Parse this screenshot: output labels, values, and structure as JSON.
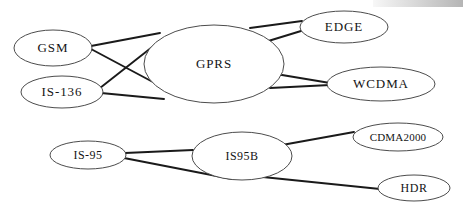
{
  "diagram": {
    "type": "node-link-graph",
    "background_color": "#ffffff",
    "node_stroke_color": "#4c4c4c",
    "edge_color": "#1a1a1a",
    "label_color": "#141414",
    "nodes": [
      {
        "id": "gsm",
        "label": "GSM",
        "cx": 53,
        "cy": 48,
        "rx": 39,
        "ry": 18,
        "font": "node-label"
      },
      {
        "id": "is136",
        "label": "IS-136",
        "cx": 62,
        "cy": 92,
        "rx": 41,
        "ry": 16,
        "font": "node-label"
      },
      {
        "id": "gprs",
        "label": "GPRS",
        "cx": 214,
        "cy": 64,
        "rx": 70,
        "ry": 39,
        "font": "node-label"
      },
      {
        "id": "edge",
        "label": "EDGE",
        "cx": 344,
        "cy": 27,
        "rx": 44,
        "ry": 16,
        "font": "node-label"
      },
      {
        "id": "wcdma",
        "label": "WCDMA",
        "cx": 381,
        "cy": 84,
        "rx": 54,
        "ry": 17,
        "font": "node-label"
      },
      {
        "id": "is95",
        "label": "IS-95",
        "cx": 88,
        "cy": 155,
        "rx": 38,
        "ry": 14,
        "font": "node-label small"
      },
      {
        "id": "is95b",
        "label": "IS95B",
        "cx": 242,
        "cy": 156,
        "rx": 50,
        "ry": 24,
        "font": "node-label small"
      },
      {
        "id": "cdma2000",
        "label": "CDMA2000",
        "cx": 398,
        "cy": 137,
        "rx": 45,
        "ry": 14,
        "font": "node-label tiny"
      },
      {
        "id": "hdr",
        "label": "HDR",
        "cx": 414,
        "cy": 188,
        "rx": 36,
        "ry": 13,
        "font": "node-label small"
      }
    ],
    "edges": [
      {
        "from": "gsm",
        "to": "gprs",
        "x1": 91,
        "y1": 46,
        "x2": 160,
        "y2": 33
      },
      {
        "from": "gsm",
        "to": "gprs",
        "x1": 91,
        "y1": 49,
        "x2": 181,
        "y2": 97
      },
      {
        "from": "is136",
        "to": "gprs",
        "x1": 100,
        "y1": 88,
        "x2": 156,
        "y2": 44
      },
      {
        "from": "is136",
        "to": "gprs",
        "x1": 101,
        "y1": 93,
        "x2": 164,
        "y2": 99
      },
      {
        "from": "gprs",
        "to": "edge",
        "x1": 250,
        "y1": 28,
        "x2": 302,
        "y2": 21
      },
      {
        "from": "gprs",
        "to": "edge",
        "x1": 252,
        "y1": 46,
        "x2": 301,
        "y2": 31
      },
      {
        "from": "gprs",
        "to": "wcdma",
        "x1": 276,
        "y1": 74,
        "x2": 330,
        "y2": 83
      },
      {
        "from": "gprs",
        "to": "wcdma",
        "x1": 270,
        "y1": 88,
        "x2": 330,
        "y2": 85
      },
      {
        "from": "is95",
        "to": "is95b",
        "x1": 125,
        "y1": 153,
        "x2": 193,
        "y2": 150
      },
      {
        "from": "is95",
        "to": "is95b",
        "x1": 124,
        "y1": 158,
        "x2": 232,
        "y2": 179
      },
      {
        "from": "is95b",
        "to": "cdma2000",
        "x1": 282,
        "y1": 145,
        "x2": 354,
        "y2": 132
      },
      {
        "from": "is95b",
        "to": "hdr",
        "x1": 253,
        "y1": 176,
        "x2": 380,
        "y2": 189
      }
    ]
  }
}
